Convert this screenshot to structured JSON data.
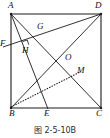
{
  "figure": {
    "caption": "图 2-5-10B",
    "shape_name": "square ABCD",
    "stroke_color": "#1a1a1a",
    "background_color": "#ffffff",
    "vertices": [
      {
        "id": "A",
        "label": "A",
        "x": 11,
        "y": 14,
        "label_x": 8,
        "label_y": 2
      },
      {
        "id": "D",
        "label": "D",
        "x": 101,
        "y": 14,
        "label_x": 96,
        "label_y": 2
      },
      {
        "id": "B",
        "label": "B",
        "x": 11,
        "y": 108,
        "label_x": 9,
        "label_y": 110
      },
      {
        "id": "C",
        "label": "C",
        "x": 101,
        "y": 108,
        "label_x": 97,
        "label_y": 110
      }
    ],
    "points": [
      {
        "id": "F",
        "label": "F",
        "x": 3,
        "y": 47,
        "label_x": 0,
        "label_y": 40
      },
      {
        "id": "G",
        "label": "G",
        "x": 40,
        "y": 33,
        "label_x": 37,
        "label_y": 23
      },
      {
        "id": "H",
        "label": "H",
        "x": 29,
        "y": 48,
        "label_x": 23,
        "label_y": 47
      },
      {
        "id": "O",
        "label": "O",
        "x": 63,
        "y": 58,
        "label_x": 64,
        "label_y": 54
      },
      {
        "id": "M",
        "label": "M",
        "x": 79,
        "y": 73,
        "label_x": 78,
        "label_y": 68
      },
      {
        "id": "E",
        "label": "E",
        "x": 48,
        "y": 108,
        "label_x": 45,
        "label_y": 110
      }
    ],
    "segments": [
      {
        "id": "AD",
        "from": "A",
        "to": "D",
        "style": "solid",
        "note": "top side of square"
      },
      {
        "id": "AB",
        "from": "A",
        "to": "B",
        "style": "solid",
        "note": "left side of square"
      },
      {
        "id": "BC",
        "from": "B",
        "to": "C",
        "style": "solid",
        "note": "bottom side of square"
      },
      {
        "id": "DC",
        "from": "D",
        "to": "C",
        "style": "solid",
        "note": "right side of square"
      },
      {
        "id": "AC",
        "from": "A",
        "to": "C",
        "style": "solid",
        "note": "diagonal"
      },
      {
        "id": "BD",
        "from": "B",
        "to": "D",
        "style": "solid",
        "note": "diagonal"
      },
      {
        "id": "AE",
        "from": "A",
        "to": "E",
        "style": "solid",
        "note": "cevian from A to E on BC"
      },
      {
        "id": "FD",
        "from": "F",
        "to": "D",
        "style": "solid",
        "note": "line through H and G"
      },
      {
        "id": "BM",
        "from": "B",
        "to": "M",
        "style": "dotted",
        "note": "dotted auxiliary segment"
      }
    ],
    "right_angle": {
      "at": "H",
      "x": 25,
      "y": 41,
      "size": 6,
      "note": "AE perpendicular to FD"
    }
  }
}
